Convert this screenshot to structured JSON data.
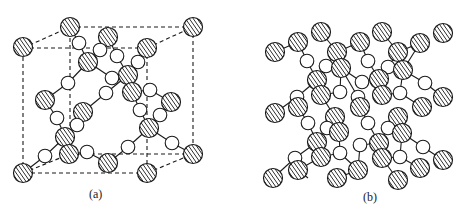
{
  "figure": {
    "panels": [
      {
        "id": "a",
        "label": "(a)",
        "description": "Unit cell with dashed cube edges, hatched and open atoms connected by bonds"
      },
      {
        "id": "b",
        "label": "(b)",
        "description": "Extended lattice of hatched and open atoms connected by bonds"
      }
    ],
    "legend_semantics": {
      "hatched_atom": "hatched-circle",
      "open_atom": "open-circle"
    },
    "colors": {
      "stroke": "#1a1a1a",
      "fill_open": "#ffffff",
      "hatch": "#1a1a1a",
      "background": "#ffffff"
    }
  },
  "panel_a": {
    "cube": {
      "front": [
        [
          23,
          48
        ],
        [
          147,
          48
        ],
        [
          147,
          173
        ],
        [
          23,
          173
        ]
      ],
      "back": [
        [
          70,
          27
        ],
        [
          193,
          27
        ],
        [
          193,
          154
        ],
        [
          70,
          154
        ]
      ]
    },
    "hatched": [
      [
        23,
        47
      ],
      [
        70,
        27
      ],
      [
        193,
        27
      ],
      [
        147,
        48
      ],
      [
        108,
        37
      ],
      [
        88,
        62
      ],
      [
        128,
        75
      ],
      [
        132,
        92
      ],
      [
        45,
        100
      ],
      [
        171,
        102
      ],
      [
        83,
        112
      ],
      [
        149,
        128
      ],
      [
        65,
        137
      ],
      [
        69,
        154
      ],
      [
        193,
        154
      ],
      [
        108,
        163
      ],
      [
        23,
        173
      ],
      [
        147,
        173
      ]
    ],
    "open": [
      [
        79,
        43
      ],
      [
        100,
        50
      ],
      [
        117,
        56
      ],
      [
        138,
        62
      ],
      [
        68,
        83
      ],
      [
        112,
        78
      ],
      [
        106,
        93
      ],
      [
        150,
        90
      ],
      [
        57,
        118
      ],
      [
        77,
        125
      ],
      [
        140,
        110
      ],
      [
        160,
        115
      ],
      [
        128,
        147
      ],
      [
        172,
        143
      ],
      [
        87,
        152
      ],
      [
        45,
        156
      ]
    ],
    "bonds": [
      [
        70,
        27,
        79,
        43
      ],
      [
        79,
        43,
        88,
        62
      ],
      [
        108,
        37,
        100,
        50
      ],
      [
        100,
        50,
        88,
        62
      ],
      [
        108,
        37,
        117,
        56
      ],
      [
        117,
        56,
        128,
        75
      ],
      [
        147,
        48,
        138,
        62
      ],
      [
        138,
        62,
        128,
        75
      ],
      [
        88,
        62,
        68,
        83
      ],
      [
        68,
        83,
        45,
        100
      ],
      [
        88,
        62,
        112,
        78
      ],
      [
        112,
        78,
        128,
        75
      ],
      [
        128,
        75,
        106,
        93
      ],
      [
        106,
        93,
        83,
        112
      ],
      [
        132,
        92,
        150,
        90
      ],
      [
        150,
        90,
        171,
        102
      ],
      [
        132,
        92,
        140,
        110
      ],
      [
        140,
        110,
        149,
        128
      ],
      [
        171,
        102,
        160,
        115
      ],
      [
        160,
        115,
        149,
        128
      ],
      [
        45,
        100,
        57,
        118
      ],
      [
        57,
        118,
        65,
        137
      ],
      [
        83,
        112,
        77,
        125
      ],
      [
        77,
        125,
        65,
        137
      ],
      [
        65,
        137,
        45,
        156
      ],
      [
        45,
        156,
        23,
        173
      ],
      [
        69,
        154,
        87,
        152
      ],
      [
        87,
        152,
        108,
        163
      ],
      [
        149,
        128,
        128,
        147
      ],
      [
        128,
        147,
        108,
        163
      ],
      [
        149,
        128,
        172,
        143
      ],
      [
        172,
        143,
        193,
        154
      ]
    ]
  },
  "panel_b": {
    "hatched": [
      [
        275,
        52
      ],
      [
        298,
        42
      ],
      [
        321,
        32
      ],
      [
        337,
        52
      ],
      [
        360,
        42
      ],
      [
        382,
        32
      ],
      [
        398,
        52
      ],
      [
        420,
        43
      ],
      [
        443,
        33
      ],
      [
        317,
        80
      ],
      [
        341,
        68
      ],
      [
        379,
        79
      ],
      [
        403,
        70
      ],
      [
        321,
        95
      ],
      [
        298,
        107
      ],
      [
        360,
        107
      ],
      [
        382,
        95
      ],
      [
        275,
        113
      ],
      [
        422,
        107
      ],
      [
        443,
        97
      ],
      [
        335,
        117
      ],
      [
        339,
        132
      ],
      [
        398,
        117
      ],
      [
        402,
        133
      ],
      [
        317,
        142
      ],
      [
        379,
        143
      ],
      [
        321,
        157
      ],
      [
        382,
        158
      ],
      [
        298,
        170
      ],
      [
        358,
        170
      ],
      [
        420,
        168
      ],
      [
        443,
        160
      ],
      [
        273,
        178
      ],
      [
        337,
        178
      ],
      [
        398,
        180
      ]
    ],
    "open": [
      [
        307,
        61
      ],
      [
        326,
        66
      ],
      [
        368,
        61
      ],
      [
        388,
        67
      ],
      [
        425,
        83
      ],
      [
        362,
        82
      ],
      [
        297,
        97
      ],
      [
        340,
        92
      ],
      [
        400,
        93
      ],
      [
        358,
        97
      ],
      [
        308,
        123
      ],
      [
        327,
        128
      ],
      [
        368,
        123
      ],
      [
        388,
        128
      ],
      [
        295,
        158
      ],
      [
        360,
        145
      ],
      [
        340,
        153
      ],
      [
        400,
        157
      ],
      [
        423,
        147
      ]
    ],
    "bonds": [
      [
        275,
        52,
        298,
        42
      ],
      [
        298,
        42,
        307,
        61
      ],
      [
        307,
        61,
        317,
        80
      ],
      [
        321,
        32,
        337,
        52
      ],
      [
        337,
        52,
        326,
        66
      ],
      [
        326,
        66,
        317,
        80
      ],
      [
        337,
        52,
        360,
        42
      ],
      [
        360,
        42,
        368,
        61
      ],
      [
        368,
        61,
        379,
        79
      ],
      [
        382,
        32,
        398,
        52
      ],
      [
        398,
        52,
        388,
        67
      ],
      [
        388,
        67,
        379,
        79
      ],
      [
        398,
        52,
        420,
        43
      ],
      [
        420,
        43,
        403,
        70
      ],
      [
        403,
        70,
        425,
        83
      ],
      [
        425,
        83,
        443,
        97
      ],
      [
        317,
        80,
        297,
        97
      ],
      [
        297,
        97,
        275,
        113
      ],
      [
        341,
        68,
        362,
        82
      ],
      [
        362,
        82,
        379,
        79
      ],
      [
        317,
        80,
        321,
        95
      ],
      [
        321,
        95,
        340,
        92
      ],
      [
        340,
        92,
        341,
        68
      ],
      [
        379,
        79,
        382,
        95
      ],
      [
        382,
        95,
        400,
        93
      ],
      [
        400,
        93,
        403,
        70
      ],
      [
        298,
        107,
        308,
        123
      ],
      [
        308,
        123,
        317,
        142
      ],
      [
        321,
        95,
        335,
        117
      ],
      [
        360,
        107,
        358,
        97
      ],
      [
        358,
        97,
        341,
        68
      ],
      [
        360,
        107,
        368,
        123
      ],
      [
        368,
        123,
        379,
        143
      ],
      [
        398,
        117,
        388,
        128
      ],
      [
        388,
        128,
        379,
        143
      ],
      [
        422,
        107,
        400,
        93
      ],
      [
        327,
        128,
        339,
        132
      ],
      [
        327,
        128,
        317,
        142
      ],
      [
        398,
        117,
        402,
        133
      ],
      [
        402,
        133,
        423,
        147
      ],
      [
        423,
        147,
        443,
        160
      ],
      [
        317,
        142,
        295,
        158
      ],
      [
        295,
        158,
        273,
        178
      ],
      [
        321,
        157,
        340,
        153
      ],
      [
        340,
        153,
        358,
        170
      ],
      [
        339,
        132,
        340,
        153
      ],
      [
        379,
        143,
        360,
        145
      ],
      [
        360,
        145,
        358,
        170
      ],
      [
        382,
        158,
        400,
        157
      ],
      [
        400,
        157,
        420,
        168
      ],
      [
        402,
        133,
        400,
        157
      ],
      [
        321,
        157,
        298,
        170
      ],
      [
        298,
        170,
        308,
        178
      ],
      [
        358,
        170,
        337,
        178
      ],
      [
        382,
        158,
        398,
        180
      ]
    ]
  }
}
